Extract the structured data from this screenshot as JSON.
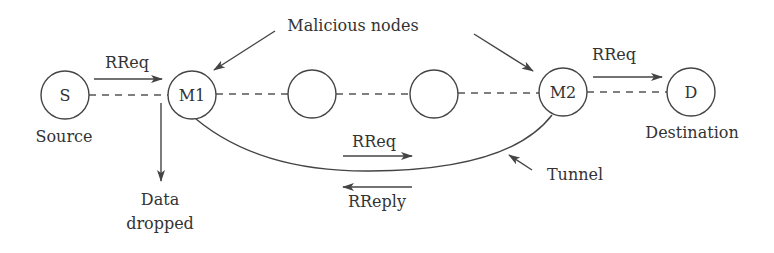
{
  "diagram": {
    "title_annotation": "Malicious nodes",
    "nodes": [
      {
        "id": "S",
        "label": "S",
        "caption": "Source"
      },
      {
        "id": "M1",
        "label": "M1",
        "caption": ""
      },
      {
        "id": "N1",
        "label": "",
        "caption": ""
      },
      {
        "id": "N2",
        "label": "",
        "caption": ""
      },
      {
        "id": "M2",
        "label": "M2",
        "caption": ""
      },
      {
        "id": "D",
        "label": "D",
        "caption": "Destination"
      }
    ],
    "messages": {
      "s_to_m1": "RReq",
      "m2_to_d": "RReq",
      "tunnel_forward": "RReq",
      "tunnel_back": "RReply"
    },
    "annotations": {
      "data_dropped_line1": "Data",
      "data_dropped_line2": "dropped",
      "tunnel": "Tunnel"
    },
    "colors": {
      "stroke": "#444444",
      "text": "#333333"
    }
  }
}
